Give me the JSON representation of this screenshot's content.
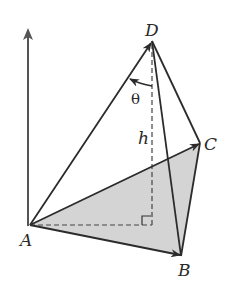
{
  "diagram": {
    "type": "tetrahedron-vectors",
    "points": {
      "A": {
        "label": "A",
        "x": 30,
        "y": 225
      },
      "B": {
        "label": "B",
        "x": 181,
        "y": 256
      },
      "C": {
        "label": "C",
        "x": 200,
        "y": 143
      },
      "D": {
        "label": "D",
        "x": 152,
        "y": 41
      },
      "foot": {
        "x": 152,
        "y": 225
      }
    },
    "labels": {
      "A": "A",
      "B": "B",
      "C": "C",
      "D": "D",
      "height": "h",
      "angle": "θ"
    },
    "vectors": [
      {
        "from": "A",
        "to": "B"
      },
      {
        "from": "A",
        "to": "C"
      },
      {
        "from": "A",
        "to": "D"
      }
    ],
    "edges": [
      {
        "from": "D",
        "to": "B"
      },
      {
        "from": "D",
        "to": "C"
      },
      {
        "from": "C",
        "to": "B"
      }
    ],
    "colors": {
      "stroke": "#2b2b2b",
      "base_fill": "#d4d4d4",
      "axis": "#555555"
    }
  }
}
